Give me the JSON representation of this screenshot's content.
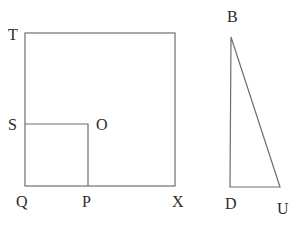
{
  "diagram": {
    "title": "",
    "stroke_color": "#6e6e6e",
    "label_color": "#2b2b2b",
    "square": {
      "points": {
        "T": [
          25,
          33
        ],
        "top_right": [
          175,
          33
        ],
        "X": [
          175,
          186
        ],
        "Q": [
          25,
          186
        ]
      },
      "labels": {
        "T": "T",
        "X": "X",
        "Q": "Q"
      }
    },
    "inner_square": {
      "points": {
        "S": [
          25,
          124
        ],
        "O": [
          88,
          124
        ],
        "P": [
          88,
          186
        ],
        "Q": [
          25,
          186
        ]
      },
      "labels": {
        "S": "S",
        "O": "O",
        "P": "P"
      }
    },
    "triangle": {
      "points": {
        "B": [
          231,
          37
        ],
        "D": [
          230,
          187
        ],
        "U": [
          280,
          187
        ]
      },
      "labels": {
        "B": "B",
        "D": "D",
        "U": "U"
      }
    }
  }
}
